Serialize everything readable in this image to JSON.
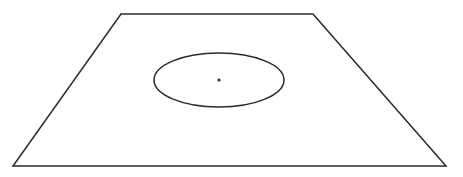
{
  "diagram": {
    "background": "#ffffff",
    "stroke_color": "#2a2a2a",
    "plane": {
      "shape": "trapezoid",
      "points": [
        [
          121,
          14
        ],
        [
          313,
          14
        ],
        [
          446,
          166
        ],
        [
          13,
          166
        ]
      ],
      "stroke_width": 1.5
    },
    "circle": {
      "shape": "ellipse",
      "cx": 219,
      "cy": 80,
      "rx": 65,
      "ry": 27,
      "stroke_width": 1.5
    },
    "center_point": {
      "cx": 219,
      "cy": 80,
      "r": 1.6
    }
  }
}
